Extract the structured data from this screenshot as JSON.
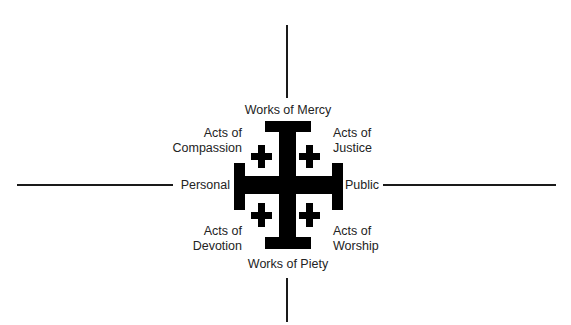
{
  "diagram": {
    "type": "quadrant-cross",
    "center_symbol": "jerusalem-cross",
    "colors": {
      "background": "#ffffff",
      "cross": "#000000",
      "lines": "#1a1a1a",
      "text": "#232323"
    },
    "axes": {
      "top": "Works of Mercy",
      "bottom": "Works of Piety",
      "left": "Personal",
      "right": "Public"
    },
    "quadrants": {
      "top_left": {
        "line1": "Acts of",
        "line2": "Compassion"
      },
      "top_right": {
        "line1": "Acts of",
        "line2": "Justice"
      },
      "bottom_left": {
        "line1": "Acts of",
        "line2": "Devotion"
      },
      "bottom_right": {
        "line1": "Acts of",
        "line2": "Worship"
      }
    }
  }
}
